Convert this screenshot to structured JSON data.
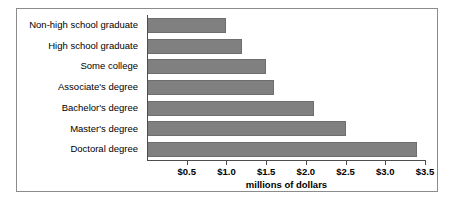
{
  "chart_data": {
    "type": "bar",
    "orientation": "horizontal",
    "title": "",
    "subtitle": "",
    "xlabel": "millions of dollars",
    "ylabel": "",
    "categories": [
      "Non-high school graduate",
      "High school graduate",
      "Some college",
      "Associate's degree",
      "Bachelor's degree",
      "Master's degree",
      "Doctoral degree"
    ],
    "values": [
      1.0,
      1.2,
      1.5,
      1.6,
      2.1,
      2.5,
      3.4
    ],
    "xlim": [
      0,
      3.5
    ],
    "xticks": [
      0.5,
      1.0,
      1.5,
      2.0,
      2.5,
      3.0,
      3.5
    ],
    "xtick_labels": [
      "$0.5",
      "$1.0",
      "$1.5",
      "$2.0",
      "$2.5",
      "$3.0",
      "$3.5"
    ],
    "grid": false,
    "legend": null,
    "legend_position": "none",
    "bar_color": "#808080",
    "bar_edge_color": "#6e6e6e",
    "axis_color": "#4d4d4d",
    "frame_color": "#8c8c8c",
    "background_color": "#ffffff"
  }
}
